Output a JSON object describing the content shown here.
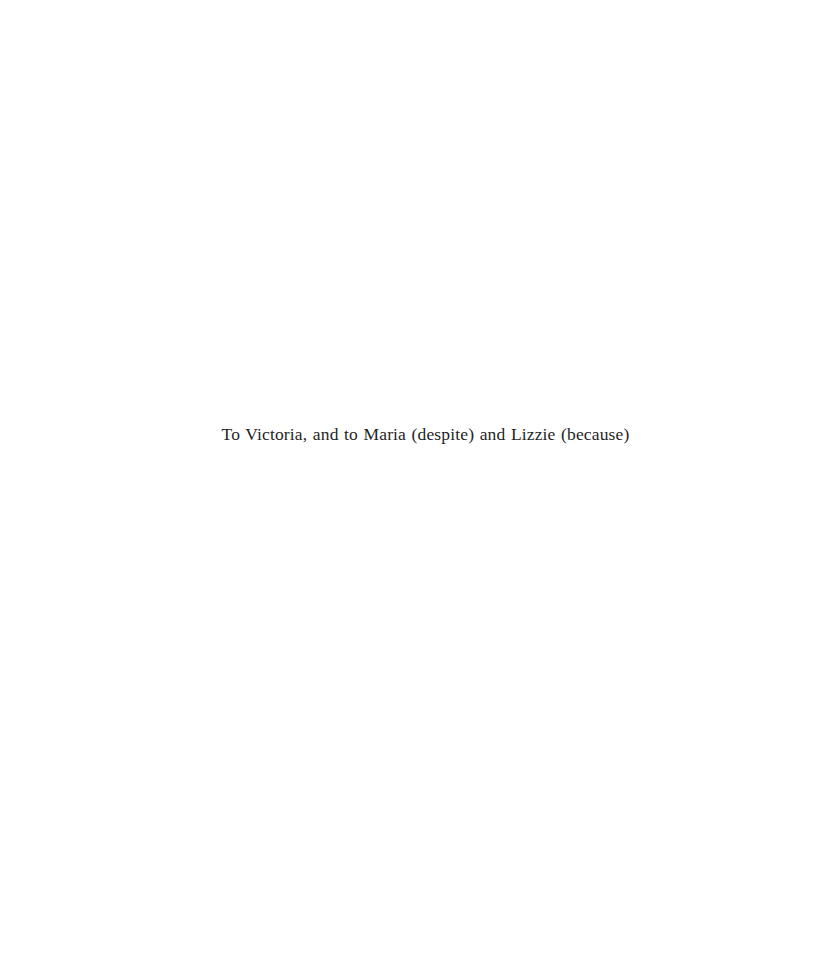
{
  "page": {
    "type": "dedication",
    "background_color": "#ffffff",
    "text_color": "#1f1f1f"
  },
  "dedication": {
    "text": "To Victoria, and to Maria (despite) and Lizzie (because)"
  }
}
